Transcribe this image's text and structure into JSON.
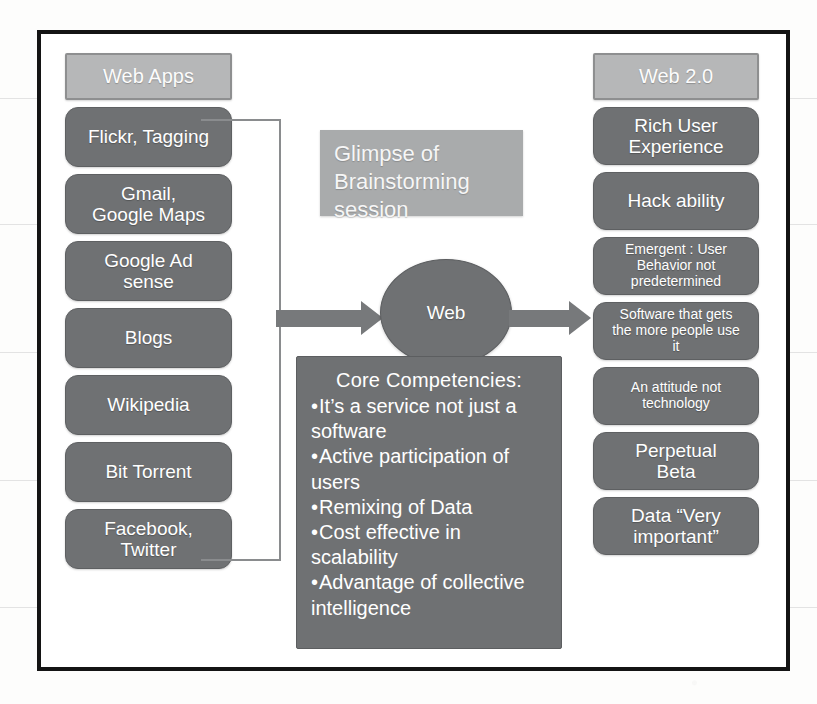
{
  "slide": {
    "left_column": {
      "header": "Web Apps",
      "items": [
        "Flickr, Tagging",
        "Gmail,\nGoogle Maps",
        "Google Ad\nsense",
        "Blogs",
        "Wikipedia",
        "Bit Torrent",
        "Facebook,\nTwitter"
      ]
    },
    "right_column": {
      "header": "Web 2.0",
      "items": [
        {
          "text": "Rich User\nExperience",
          "size": "large"
        },
        {
          "text": "Hack ability",
          "size": "large"
        },
        {
          "text": "Emergent : User\nBehavior not\npredetermined",
          "size": "small"
        },
        {
          "text": "Software that gets\nthe more people use\nit",
          "size": "small"
        },
        {
          "text": "An attitude not\ntechnology",
          "size": "small"
        },
        {
          "text": "Perpetual\nBeta",
          "size": "large"
        },
        {
          "text": "Data “Very\nimportant”",
          "size": "large"
        }
      ]
    },
    "note": "Glimpse of\nBrainstorming\nsession",
    "center_node": "Web",
    "core_panel": {
      "title": "Core Competencies:",
      "bullets": [
        "It’s a service not just a software",
        "Active participation of users",
        "Remixing of Data",
        "Cost effective in scalability",
        "Advantage of collective intelligence"
      ]
    }
  },
  "colors": {
    "frame": "#141414",
    "header_box": "#b6b7b8",
    "item_box": "#6f7173",
    "note_box": "#a9abac",
    "arrow": "#77797b",
    "text": "#ffffff",
    "page": "#fdfdfc"
  }
}
